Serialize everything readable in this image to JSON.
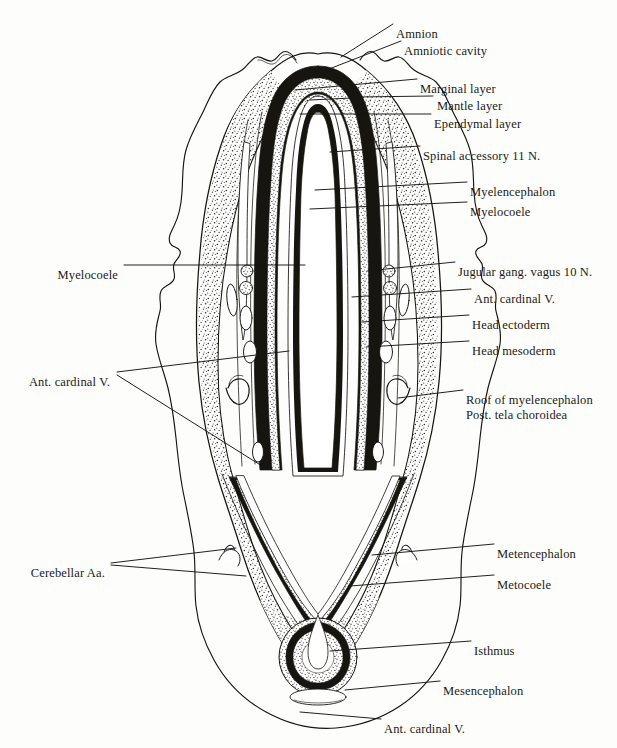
{
  "figure": {
    "kind": "anatomical-line-drawing",
    "background_color": "#fdfdfb",
    "ink_color": "#16150f",
    "stipple_color": "#2a2a24"
  },
  "labels_right": [
    {
      "id": "amnion",
      "text": "Amnion",
      "x": 396,
      "y": 27
    },
    {
      "id": "amniotic-cavity",
      "text": "Amniotic cavity",
      "x": 404,
      "y": 44
    },
    {
      "id": "marginal-layer",
      "text": "Marginal layer",
      "x": 420,
      "y": 82
    },
    {
      "id": "mantle-layer",
      "text": "Mantle layer",
      "x": 437,
      "y": 99
    },
    {
      "id": "ependymal-layer",
      "text": "Ependymal layer",
      "x": 434,
      "y": 117
    },
    {
      "id": "spinal-accessory",
      "text": "Spinal accessory 11 N.",
      "x": 423,
      "y": 149
    },
    {
      "id": "myelencephalon",
      "text": "Myelencephalon",
      "x": 470,
      "y": 185
    },
    {
      "id": "myelocoele-r",
      "text": "Myelocoele",
      "x": 470,
      "y": 205
    },
    {
      "id": "jugular-vagus",
      "text": "Jugular gang. vagus 10 N.",
      "x": 458,
      "y": 265
    },
    {
      "id": "ant-cardinal-v-r",
      "text": "Ant. cardinal V.",
      "x": 474,
      "y": 292
    },
    {
      "id": "head-ectoderm",
      "text": "Head ectoderm",
      "x": 472,
      "y": 318
    },
    {
      "id": "head-mesoderm",
      "text": "Head mesoderm",
      "x": 472,
      "y": 344
    },
    {
      "id": "metencephalon",
      "text": "Metencephalon",
      "x": 497,
      "y": 547
    },
    {
      "id": "metocoele",
      "text": "Metocoele",
      "x": 497,
      "y": 578
    },
    {
      "id": "isthmus",
      "text": "Isthmus",
      "x": 474,
      "y": 644
    },
    {
      "id": "mesencephalon",
      "text": "Mesencephalon",
      "x": 443,
      "y": 684
    },
    {
      "id": "ant-cardinal-v-b",
      "text": "Ant. cardinal V.",
      "x": 384,
      "y": 722
    }
  ],
  "labels_right_multiline": [
    {
      "id": "roof-myelencephalon",
      "line1": "Roof of myelencephalon",
      "line2": "Post. tela choroidea",
      "x": 466,
      "y": 393
    }
  ],
  "labels_left": [
    {
      "id": "myelocoele-l",
      "text": "Myelocoele",
      "x": 118,
      "y": 268
    },
    {
      "id": "ant-cardinal-v-l",
      "text": "Ant. cardinal V.",
      "x": 110,
      "y": 375
    },
    {
      "id": "cerebellar-aa",
      "text": "Cerebellar Aa.",
      "x": 105,
      "y": 566
    }
  ],
  "leaders_right": [
    {
      "id": "leader-amnion",
      "d": "M 341 57 L 393 24"
    },
    {
      "id": "leader-amniotic-cavity",
      "d": "M 329 69 L 401 41"
    },
    {
      "id": "leader-marginal-layer",
      "d": "M 295 90 L 417 79"
    },
    {
      "id": "leader-mantle-layer",
      "d": "M 310 100 L 352 98 M 358 97 L 433 96"
    },
    {
      "id": "leader-ependymal-layer",
      "d": "M 300 114 L 431 114"
    },
    {
      "id": "leader-spinal-accessory",
      "d": "M 330 152 L 420 146"
    },
    {
      "id": "leader-myelencephalon",
      "d": "M 315 190 L 467 182"
    },
    {
      "id": "leader-myelocoele-r",
      "d": "M 310 209 L 467 202"
    },
    {
      "id": "leader-jugular-vagus",
      "d": "M 367 271 L 455 262"
    },
    {
      "id": "leader-ant-cardinal-v-r",
      "d": "M 352 297 L 471 289"
    },
    {
      "id": "leader-head-ectoderm",
      "d": "M 362 322 L 469 315"
    },
    {
      "id": "leader-head-mesoderm",
      "d": "M 366 347 L 469 341"
    },
    {
      "id": "leader-roof-myelen",
      "d": "M 398 398 L 463 390"
    },
    {
      "id": "leader-metencephalon",
      "d": "M 372 555 L 494 544"
    },
    {
      "id": "leader-metocoele",
      "d": "M 350 586 L 494 575"
    },
    {
      "id": "leader-isthmus",
      "d": "M 330 651 L 471 641"
    },
    {
      "id": "leader-mesencephalon",
      "d": "M 345 690 L 440 681"
    },
    {
      "id": "leader-ant-cardinal-v-b",
      "d": "M 300 712 L 381 719"
    }
  ],
  "leaders_left": [
    {
      "id": "leader-myelocoele-l",
      "d": "M 124 265 L 305 265"
    },
    {
      "id": "leader-ant-cardinal-v-l-a",
      "d": "M 117 372 L 289 351"
    },
    {
      "id": "leader-ant-cardinal-v-l-b",
      "d": "M 117 375 L 262 466"
    },
    {
      "id": "leader-cerebellar-aa-a",
      "d": "M 111 563 L 236 548"
    },
    {
      "id": "leader-cerebellar-aa-b",
      "d": "M 111 565 L 246 576"
    }
  ],
  "structures": {
    "amnion_outline": "thin wavy membrane enclosing the embryo head",
    "neural_tube_black": "marginal layer rendered solid black",
    "mantle_stipple": "mantle layer rendered as dense stipple",
    "lumen_white": "myelocoele / metocoele lumen left white"
  }
}
